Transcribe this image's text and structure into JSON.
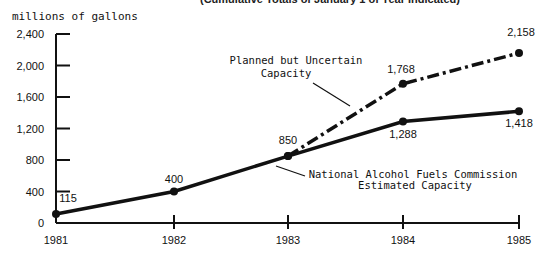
{
  "chart_data": {
    "type": "line",
    "title": "",
    "subtitle": "(Cumulative Totals of January 1 of Year Indicated)",
    "xlabel": "",
    "ylabel": "millions of gallons",
    "ylim": [
      0,
      2400
    ],
    "yticks": [
      0,
      400,
      800,
      1200,
      1600,
      2000,
      2400
    ],
    "ytick_labels": [
      "0",
      "400",
      "800",
      "1,200",
      "1,600",
      "2,000",
      "2,400"
    ],
    "x": [
      1981,
      1982,
      1983,
      1984,
      1985
    ],
    "xtick_labels": [
      "1981",
      "1982",
      "1983",
      "1984",
      "1985"
    ],
    "grid": false,
    "legend": "inline annotations",
    "series": [
      {
        "name": "National Alcohol Fuels Commission Estimated Capacity",
        "style": "solid",
        "x": [
          1981,
          1982,
          1983,
          1984,
          1985
        ],
        "values": [
          115,
          400,
          850,
          1288,
          1418
        ],
        "labels": [
          "115",
          "400",
          "850",
          "1,288",
          "1,418"
        ]
      },
      {
        "name": "Planned but Uncertain Capacity",
        "style": "dash-dot",
        "x": [
          1983,
          1984,
          1985
        ],
        "values": [
          850,
          1768,
          2158
        ],
        "labels": [
          "850",
          "1,768",
          "2,158"
        ]
      }
    ],
    "annotations": [
      {
        "line1": "Planned but Uncertain",
        "line2": "Capacity"
      },
      {
        "line1": "National Alcohol Fuels Commission",
        "line2": "Estimated Capacity"
      }
    ]
  }
}
